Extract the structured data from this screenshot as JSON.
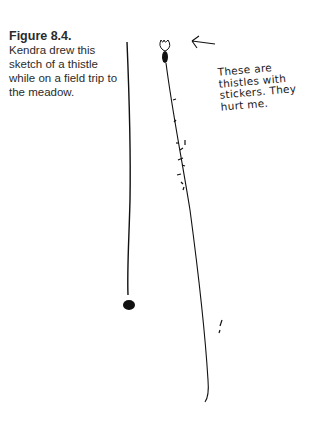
{
  "figure": {
    "label": "Figure 8.4.",
    "caption": "Kendra drew this sketch of a thistle while on a field trip to the meadow."
  },
  "drawing": {
    "subject": "thistle sketch",
    "annotation_lines": [
      "These are",
      "thistles with",
      "stickers. They",
      "hurt me."
    ],
    "ink_color": "#111111"
  }
}
